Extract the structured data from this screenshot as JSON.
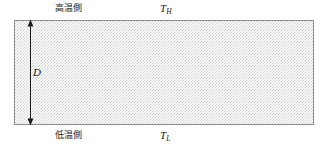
{
  "figure": {
    "slab": {
      "name": "hatched-slab",
      "fill_pattern": "fine-checker-hatch",
      "pattern_color": "#d2d2d2",
      "border_color": "#8d8d8d",
      "background_color": "#ffffff"
    },
    "labels": {
      "hot_side": "高温側",
      "cold_side": "低温側",
      "temperature_hot": {
        "symbol": "T",
        "subscript": "H"
      },
      "temperature_cold": {
        "symbol": "T",
        "subscript": "L"
      },
      "thickness": "D"
    },
    "dimension_arrow": {
      "name": "thickness-dimension-arrow",
      "orientation": "vertical",
      "heads": "double",
      "color": "#1a1a1a"
    }
  }
}
